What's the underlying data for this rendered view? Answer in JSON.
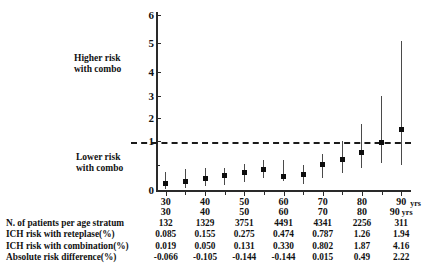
{
  "annotations": {
    "higher_risk": "Higher risk\nwith combo",
    "higher_risk_line1": "Higher risk",
    "higher_risk_line2": "with combo",
    "lower_risk_line1": "Lower risk",
    "lower_risk_line2": "with combo"
  },
  "axis": {
    "y_ticks": [
      "0",
      "1",
      "2",
      "3",
      "4",
      "5",
      "6"
    ],
    "x_ticks": [
      "30",
      "40",
      "50",
      "60",
      "70",
      "80",
      "90"
    ],
    "x_units": "yrs"
  },
  "table": {
    "header": [
      "30",
      "40",
      "50",
      "60",
      "70",
      "80",
      "90"
    ],
    "header_units": "yrs",
    "rows": [
      {
        "label": "N. of patients per age stratum",
        "values": [
          "132",
          "1329",
          "3751",
          "4491",
          "4341",
          "2256",
          "311"
        ]
      },
      {
        "label": "ICH risk with reteplase(%)",
        "values": [
          "0.085",
          "0.155",
          "0.275",
          "0.474",
          "0.787",
          "1.26",
          "1.94"
        ]
      },
      {
        "label": "ICH risk with combination(%)",
        "values": [
          "0.019",
          "0.050",
          "0.131",
          "0.330",
          "0.802",
          "1.87",
          "4.16"
        ]
      },
      {
        "label": "Absolute risk difference(%)",
        "values": [
          "-0.066",
          "-0.105",
          "-0.144",
          "-0.144",
          "0.015",
          "0.49",
          "2.22"
        ]
      }
    ]
  },
  "chart_data": {
    "type": "scatter",
    "title": "",
    "xlabel": "",
    "ylabel": "",
    "xlim": [
      27.5,
      92.5
    ],
    "ylim": [
      0,
      6
    ],
    "grid": false,
    "legend": null,
    "reference_line": {
      "y": 1,
      "style": "dashed",
      "color": "#1a1a1a"
    },
    "marker_color": "#0d0d0d",
    "errorbar_color": "#4a4a4a",
    "x": [
      30,
      35,
      40,
      45,
      50,
      55,
      60,
      65,
      70,
      75,
      80,
      85,
      90
    ],
    "y": [
      0.25,
      0.35,
      0.45,
      0.58,
      0.72,
      0.82,
      1.0,
      0.62,
      1.02,
      1.22,
      1.53,
      1.92,
      2.45
    ],
    "values": [
      0.25,
      0.35,
      0.45,
      0.58,
      0.72,
      0.82,
      0.53,
      0.62,
      1.02,
      1.22,
      1.53,
      1.92,
      2.45
    ],
    "ci_low": [
      0.05,
      0.1,
      0.17,
      0.21,
      0.32,
      0.48,
      0.35,
      0.25,
      0.48,
      0.7,
      0.9,
      1.08,
      1.0
    ],
    "ci_high": [
      0.72,
      0.85,
      0.88,
      0.9,
      1.05,
      1.22,
      1.22,
      1.03,
      1.48,
      2.0,
      2.68,
      3.82,
      6.05
    ]
  }
}
